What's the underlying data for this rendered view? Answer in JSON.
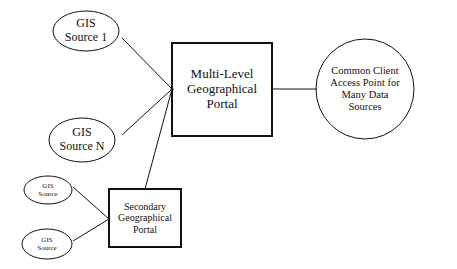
{
  "diagram": {
    "nodes": {
      "gis_source_1": {
        "label": "GIS\nSource 1",
        "shape": "ellipse"
      },
      "gis_source_n": {
        "label": "GIS\nSource N",
        "shape": "ellipse"
      },
      "multi_level_portal": {
        "label": "Multi-Level\nGeographical\nPortal",
        "shape": "rectangle"
      },
      "common_client": {
        "label": "Common Client\nAccess Point for\nMany Data\nSources",
        "shape": "ellipse"
      },
      "secondary_portal": {
        "label": "Secondary\nGeographical\nPortal",
        "shape": "rectangle"
      },
      "gis_source_a": {
        "label": "GIS\nSource",
        "shape": "ellipse"
      },
      "gis_source_b": {
        "label": "GIS\nSource",
        "shape": "ellipse"
      }
    },
    "edges": [
      {
        "from": "gis_source_1",
        "to": "multi_level_portal"
      },
      {
        "from": "gis_source_n",
        "to": "multi_level_portal"
      },
      {
        "from": "secondary_portal",
        "to": "multi_level_portal"
      },
      {
        "from": "multi_level_portal",
        "to": "common_client"
      },
      {
        "from": "gis_source_a",
        "to": "secondary_portal"
      },
      {
        "from": "gis_source_b",
        "to": "secondary_portal"
      }
    ]
  }
}
